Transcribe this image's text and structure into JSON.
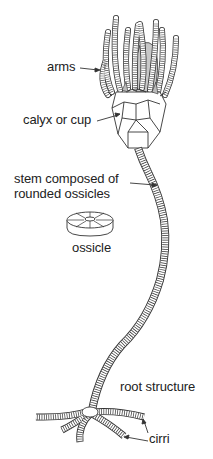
{
  "diagram": {
    "labels": {
      "arms": "arms",
      "calyx": "calyx or cup",
      "stem_line1": "stem composed of",
      "stem_line2": "rounded ossicles",
      "ossicle": "ossicle",
      "root": "root structure",
      "cirri": "cirri"
    },
    "colors": {
      "line": "#2a2a2a",
      "shade": "#c8c8c8",
      "background": "#ffffff"
    }
  }
}
